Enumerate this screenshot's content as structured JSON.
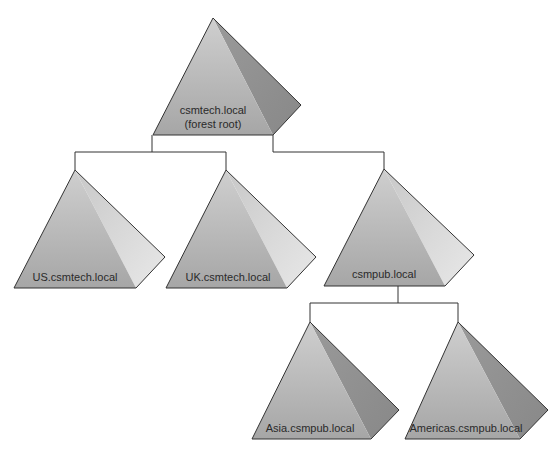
{
  "diagram": {
    "type": "active-directory-forest-tree",
    "nodes": [
      {
        "id": "root",
        "label": "csmtech.local",
        "sublabel": "(forest root)",
        "style": "dark"
      },
      {
        "id": "us",
        "label": "US.csmtech.local",
        "parent": "root",
        "style": "light"
      },
      {
        "id": "uk",
        "label": "UK.csmtech.local",
        "parent": "root",
        "style": "light"
      },
      {
        "id": "csmpub",
        "label": "csmpub.local",
        "parent": "root",
        "style": "light"
      },
      {
        "id": "asia",
        "label": "Asia.csmpub.local",
        "parent": "csmpub",
        "style": "dark"
      },
      {
        "id": "americas",
        "label": "Americas.csmpub.local",
        "parent": "csmpub",
        "style": "dark"
      }
    ],
    "edges": [
      {
        "from": "root",
        "to": "us"
      },
      {
        "from": "root",
        "to": "uk"
      },
      {
        "from": "root",
        "to": "csmpub"
      },
      {
        "from": "csmpub",
        "to": "asia"
      },
      {
        "from": "csmpub",
        "to": "americas"
      }
    ]
  },
  "labels": {
    "root": "csmtech.local",
    "root_sub": "(forest root)",
    "us": "US.csmtech.local",
    "uk": "UK.csmtech.local",
    "csmpub": "csmpub.local",
    "asia": "Asia.csmpub.local",
    "americas": "Americas.csmpub.local"
  },
  "colors": {
    "front_face": "#b4b4b4",
    "right_face_dark": "#8e8e8e",
    "right_face_light": "#dedede",
    "outline": "#333333"
  }
}
